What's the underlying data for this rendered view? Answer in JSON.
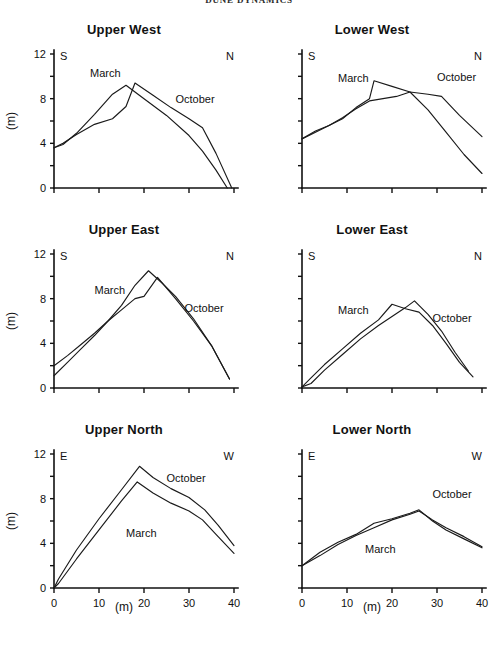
{
  "figure": {
    "running_head": "DUNE DYNAMICS",
    "axis_label_y": "(m)",
    "axis_label_x": "(m)"
  },
  "chart_data": [
    {
      "type": "line",
      "title": "Upper West",
      "xlabel": "(m)",
      "ylabel": "(m)",
      "xlim": [
        0,
        40
      ],
      "ylim": [
        0,
        12
      ],
      "xticks": [
        0,
        10,
        20,
        30,
        40
      ],
      "yticks": [
        0,
        4,
        8,
        12
      ],
      "xtick_labels": [
        "",
        "",
        "",
        "",
        ""
      ],
      "ytick_labels": [
        "0",
        "4",
        "8",
        "12"
      ],
      "grid": false,
      "left_edge_label": "S",
      "right_edge_label": "N",
      "legend": "inline-annotations",
      "series": [
        {
          "name": "March",
          "label_x": 8,
          "label_y": 9.9,
          "x": [
            0,
            2,
            5,
            9,
            13,
            16,
            20,
            25,
            30,
            33,
            36,
            38.5
          ],
          "y": [
            3.6,
            3.9,
            4.9,
            6.6,
            8.4,
            9.2,
            8.0,
            6.5,
            4.7,
            3.3,
            1.6,
            0.0
          ]
        },
        {
          "name": "October",
          "label_x": 27,
          "label_y": 7.6,
          "x": [
            0,
            2,
            5,
            9,
            13,
            16,
            18,
            22,
            26,
            30,
            33,
            36,
            39.5
          ],
          "y": [
            3.6,
            4.0,
            4.8,
            5.7,
            6.2,
            7.3,
            9.4,
            8.3,
            7.2,
            6.2,
            5.4,
            3.1,
            0.0
          ]
        }
      ]
    },
    {
      "type": "line",
      "title": "Lower West",
      "xlabel": "(m)",
      "ylabel": "(m)",
      "xlim": [
        0,
        40
      ],
      "ylim": [
        0,
        12
      ],
      "xticks": [
        0,
        10,
        20,
        30,
        40
      ],
      "yticks": [
        0,
        4,
        8,
        12
      ],
      "xtick_labels": [
        "",
        "",
        "",
        "",
        ""
      ],
      "ytick_labels": [
        "",
        "",
        "",
        ""
      ],
      "grid": false,
      "left_edge_label": "S",
      "right_edge_label": "N",
      "legend": "inline-annotations",
      "series": [
        {
          "name": "March",
          "label_x": 8,
          "label_y": 9.5,
          "x": [
            0,
            3,
            6,
            9,
            12,
            15,
            16,
            20,
            24,
            28,
            32,
            36,
            40
          ],
          "y": [
            4.4,
            5.1,
            5.6,
            6.2,
            7.2,
            8.0,
            9.6,
            9.1,
            8.6,
            7.0,
            5.0,
            3.0,
            1.3
          ]
        },
        {
          "name": "October",
          "label_x": 30,
          "label_y": 9.6,
          "x": [
            0,
            3,
            6,
            9,
            12,
            15,
            18,
            21,
            24,
            28,
            31,
            35,
            40
          ],
          "y": [
            4.4,
            5.0,
            5.6,
            6.3,
            7.1,
            7.8,
            8.0,
            8.2,
            8.6,
            8.4,
            8.2,
            6.5,
            4.6
          ]
        }
      ]
    },
    {
      "type": "line",
      "title": "Upper East",
      "xlabel": "(m)",
      "ylabel": "(m)",
      "xlim": [
        0,
        40
      ],
      "ylim": [
        0,
        12
      ],
      "xticks": [
        0,
        10,
        20,
        30,
        40
      ],
      "yticks": [
        0,
        4,
        8,
        12
      ],
      "xtick_labels": [
        "",
        "",
        "",
        "",
        ""
      ],
      "ytick_labels": [
        "0",
        "4",
        "8",
        "12"
      ],
      "grid": false,
      "left_edge_label": "S",
      "right_edge_label": "N",
      "legend": "inline-annotations",
      "series": [
        {
          "name": "March",
          "label_x": 9,
          "label_y": 8.4,
          "x": [
            0,
            3,
            6,
            9,
            12,
            15,
            18,
            20,
            23,
            27,
            31,
            35,
            39
          ],
          "y": [
            2.0,
            2.9,
            3.9,
            4.9,
            6.0,
            7.0,
            8.0,
            8.2,
            9.9,
            8.0,
            6.0,
            3.8,
            0.8
          ]
        },
        {
          "name": "October",
          "label_x": 29,
          "label_y": 6.8,
          "x": [
            0,
            3,
            6,
            9,
            12,
            15,
            18,
            21,
            24,
            27,
            31,
            35,
            39
          ],
          "y": [
            1.1,
            2.3,
            3.5,
            4.7,
            6.0,
            7.4,
            9.2,
            10.5,
            9.4,
            8.2,
            6.2,
            3.8,
            0.8
          ]
        }
      ]
    },
    {
      "type": "line",
      "title": "Lower East",
      "xlabel": "(m)",
      "ylabel": "(m)",
      "xlim": [
        0,
        40
      ],
      "ylim": [
        0,
        12
      ],
      "xticks": [
        0,
        10,
        20,
        30,
        40
      ],
      "yticks": [
        0,
        4,
        8,
        12
      ],
      "xtick_labels": [
        "",
        "",
        "",
        "",
        ""
      ],
      "ytick_labels": [
        "",
        "",
        "",
        ""
      ],
      "grid": false,
      "left_edge_label": "S",
      "right_edge_label": "N",
      "legend": "inline-annotations",
      "series": [
        {
          "name": "March",
          "label_x": 8,
          "label_y": 6.6,
          "x": [
            0,
            2,
            5,
            9,
            13,
            17,
            20,
            23,
            26,
            29,
            32,
            35,
            38
          ],
          "y": [
            0.1,
            0.9,
            2.1,
            3.5,
            4.9,
            6.1,
            7.5,
            7.1,
            6.8,
            5.6,
            4.0,
            2.3,
            1.0
          ]
        },
        {
          "name": "October",
          "label_x": 29,
          "label_y": 5.9,
          "x": [
            0,
            2,
            5,
            9,
            13,
            17,
            20,
            23,
            25,
            28,
            31,
            34,
            37
          ],
          "y": [
            0.1,
            0.4,
            1.6,
            3.0,
            4.4,
            5.6,
            6.4,
            7.2,
            7.8,
            6.6,
            5.1,
            3.2,
            1.5
          ]
        }
      ]
    },
    {
      "type": "line",
      "title": "Upper North",
      "xlabel": "(m)",
      "ylabel": "(m)",
      "xlim": [
        0,
        40
      ],
      "ylim": [
        0,
        12
      ],
      "xticks": [
        0,
        10,
        20,
        30,
        40
      ],
      "yticks": [
        0,
        4,
        8,
        12
      ],
      "xtick_labels": [
        "0",
        "10",
        "20",
        "30",
        "40"
      ],
      "ytick_labels": [
        "0",
        "4",
        "8",
        "12"
      ],
      "grid": false,
      "left_edge_label": "E",
      "right_edge_label": "W",
      "legend": "inline-annotations",
      "series": [
        {
          "name": "March",
          "label_x": 16,
          "label_y": 4.6,
          "x": [
            0,
            1,
            5,
            10,
            15,
            18.5,
            22,
            26,
            30,
            33,
            36,
            40
          ],
          "y": [
            0.0,
            0.4,
            2.6,
            5.2,
            7.8,
            9.5,
            8.5,
            7.6,
            6.9,
            6.1,
            4.8,
            3.1
          ]
        },
        {
          "name": "October",
          "label_x": 25,
          "label_y": 9.5,
          "x": [
            0,
            1,
            5,
            10,
            15,
            19,
            22,
            26,
            30,
            33.5,
            36.5,
            40
          ],
          "y": [
            0.0,
            0.8,
            3.4,
            6.2,
            8.8,
            10.9,
            9.9,
            8.9,
            8.1,
            7.0,
            5.6,
            3.8
          ]
        }
      ]
    },
    {
      "type": "line",
      "title": "Lower North",
      "xlabel": "(m)",
      "ylabel": "(m)",
      "xlim": [
        0,
        40
      ],
      "ylim": [
        0,
        12
      ],
      "xticks": [
        0,
        10,
        20,
        30,
        40
      ],
      "yticks": [
        0,
        4,
        8,
        12
      ],
      "xtick_labels": [
        "0",
        "10",
        "20",
        "30",
        "40"
      ],
      "ytick_labels": [
        "",
        "",
        "",
        ""
      ],
      "grid": false,
      "left_edge_label": "E",
      "right_edge_label": "W",
      "legend": "inline-annotations",
      "series": [
        {
          "name": "March",
          "label_x": 14,
          "label_y": 3.1,
          "x": [
            0,
            4,
            8,
            12,
            16,
            20,
            24,
            26,
            29,
            32,
            36,
            40
          ],
          "y": [
            2.0,
            2.9,
            3.9,
            4.7,
            5.4,
            6.1,
            6.6,
            6.9,
            6.1,
            5.4,
            4.6,
            3.7
          ]
        },
        {
          "name": "October",
          "label_x": 29,
          "label_y": 8.1,
          "x": [
            0,
            4,
            8,
            12,
            16,
            20,
            24,
            26,
            29,
            32,
            36,
            40
          ],
          "y": [
            2.0,
            3.2,
            4.1,
            4.8,
            5.8,
            6.2,
            6.7,
            7.0,
            6.0,
            5.2,
            4.4,
            3.6
          ]
        }
      ]
    }
  ]
}
